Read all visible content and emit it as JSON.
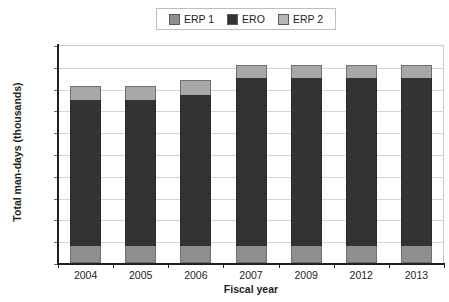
{
  "chart_data": {
    "type": "bar",
    "stacked": true,
    "title": "",
    "xlabel": "Fiscal year",
    "ylabel": "Total man-days (thousands)",
    "categories": [
      "2004",
      "2005",
      "2006",
      "2007",
      "2009",
      "2012",
      "2013"
    ],
    "series": [
      {
        "name": "ERP 1",
        "color": "#8f8f8f",
        "values": [
          400,
          400,
          400,
          400,
          400,
          400,
          400
        ]
      },
      {
        "name": "ERO",
        "color": "#333333",
        "values": [
          3350,
          3350,
          3450,
          3850,
          3850,
          3850,
          3850
        ]
      },
      {
        "name": "ERP 2",
        "color": "#a8a8a8",
        "values": [
          300,
          300,
          350,
          300,
          300,
          300,
          300
        ]
      }
    ],
    "totals": [
      4050,
      4050,
      4200,
      4550,
      4550,
      4550,
      4550
    ],
    "ylim": [
      0,
      5000
    ],
    "ytick_step": 500,
    "ytick_labels": [
      "5,000",
      "4,500",
      "4,000",
      "3,500",
      "3,000",
      "2,500",
      "2,000",
      "1,500",
      "1,000",
      "500",
      "0"
    ],
    "grid": true,
    "legend_position": "top-center"
  },
  "legend": {
    "entries": [
      {
        "label": "ERP 1",
        "swatch": "#8f8f8f"
      },
      {
        "label": "ERO",
        "swatch": "#333333"
      },
      {
        "label": "ERP 2",
        "swatch": "#b8b8b8"
      }
    ]
  }
}
